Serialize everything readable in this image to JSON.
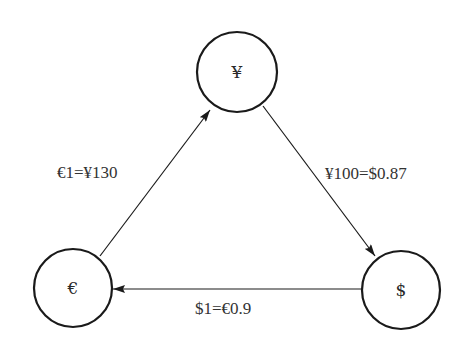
{
  "diagram": {
    "type": "directed-graph",
    "title": "",
    "nodes": [
      {
        "id": "yen",
        "label": "¥",
        "cx": 237,
        "cy": 72,
        "r": 40
      },
      {
        "id": "euro",
        "label": "€",
        "cx": 73,
        "cy": 288,
        "r": 39
      },
      {
        "id": "dollar",
        "label": "$",
        "cx": 401,
        "cy": 290,
        "r": 39
      }
    ],
    "edges": [
      {
        "from": "euro",
        "to": "yen",
        "label": "€1=¥130"
      },
      {
        "from": "yen",
        "to": "dollar",
        "label": "¥100=$0.87"
      },
      {
        "from": "dollar",
        "to": "euro",
        "label": "$1=€0.9"
      }
    ],
    "colors": {
      "stroke": "#1a1a1a",
      "text": "#333333",
      "background": "#ffffff"
    }
  }
}
